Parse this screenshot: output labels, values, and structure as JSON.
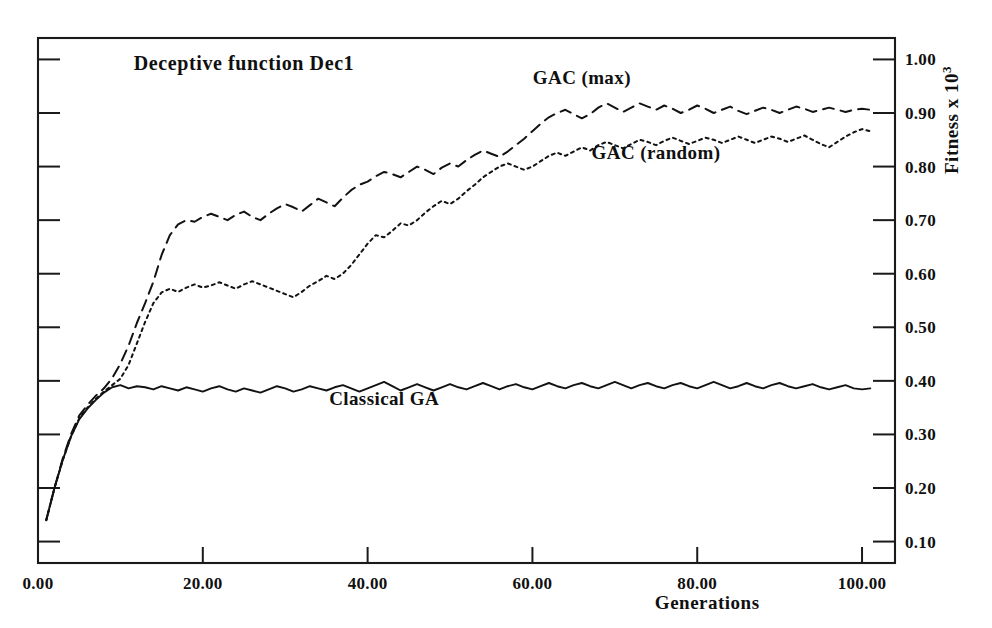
{
  "chart_data": {
    "type": "line",
    "title": "Deceptive function Dec1",
    "xlabel": "Generations",
    "ylabel": "Fitness x 10",
    "ylabel_exponent": "3",
    "xlim": [
      0,
      104
    ],
    "ylim": [
      0.06,
      1.04
    ],
    "xticks": [
      0,
      20,
      40,
      60,
      80,
      100
    ],
    "xtick_labels": [
      "0.00",
      "20.00",
      "40.00",
      "60.00",
      "80.00",
      "100.00"
    ],
    "yticks": [
      0.1,
      0.2,
      0.3,
      0.4,
      0.5,
      0.6,
      0.7,
      0.8,
      0.9,
      1.0
    ],
    "ytick_labels": [
      "0.10",
      "0.20",
      "0.30",
      "0.40",
      "0.50",
      "0.60",
      "0.70",
      "0.80",
      "0.90",
      "1.00"
    ],
    "grid": false,
    "legend_position": "inline-annotations",
    "y_axis_side": "right",
    "series": [
      {
        "name": "GAC (max)",
        "style": "dashed",
        "label_x": 66,
        "label_y": 0.955,
        "x": [
          1,
          2,
          3,
          4,
          5,
          6,
          7,
          8,
          9,
          10,
          11,
          12,
          13,
          14,
          15,
          16,
          17,
          18,
          19,
          20,
          21,
          22,
          23,
          24,
          25,
          26,
          27,
          28,
          29,
          30,
          31,
          32,
          33,
          34,
          35,
          36,
          37,
          38,
          39,
          40,
          41,
          42,
          43,
          44,
          45,
          46,
          47,
          48,
          49,
          50,
          51,
          52,
          53,
          54,
          55,
          56,
          57,
          58,
          59,
          60,
          61,
          62,
          63,
          64,
          65,
          66,
          67,
          68,
          69,
          70,
          71,
          72,
          73,
          74,
          75,
          76,
          77,
          78,
          79,
          80,
          81,
          82,
          83,
          84,
          85,
          86,
          87,
          88,
          89,
          90,
          91,
          92,
          93,
          94,
          95,
          96,
          97,
          98,
          99,
          100,
          101
        ],
        "y": [
          0.14,
          0.2,
          0.255,
          0.3,
          0.335,
          0.355,
          0.372,
          0.386,
          0.405,
          0.432,
          0.466,
          0.508,
          0.545,
          0.585,
          0.635,
          0.672,
          0.692,
          0.7,
          0.697,
          0.706,
          0.712,
          0.706,
          0.7,
          0.71,
          0.716,
          0.706,
          0.7,
          0.712,
          0.722,
          0.73,
          0.724,
          0.716,
          0.728,
          0.74,
          0.733,
          0.726,
          0.742,
          0.756,
          0.766,
          0.772,
          0.782,
          0.79,
          0.786,
          0.78,
          0.79,
          0.8,
          0.794,
          0.786,
          0.798,
          0.806,
          0.8,
          0.812,
          0.822,
          0.83,
          0.824,
          0.818,
          0.828,
          0.84,
          0.852,
          0.866,
          0.88,
          0.892,
          0.9,
          0.906,
          0.898,
          0.89,
          0.898,
          0.91,
          0.918,
          0.91,
          0.902,
          0.91,
          0.918,
          0.912,
          0.906,
          0.914,
          0.908,
          0.9,
          0.906,
          0.914,
          0.908,
          0.9,
          0.906,
          0.912,
          0.904,
          0.898,
          0.904,
          0.91,
          0.906,
          0.9,
          0.906,
          0.912,
          0.908,
          0.902,
          0.906,
          0.91,
          0.906,
          0.902,
          0.906,
          0.908,
          0.906
        ]
      },
      {
        "name": "GAC (random)",
        "style": "dotted",
        "label_x": 75,
        "label_y": 0.815,
        "x": [
          1,
          2,
          3,
          4,
          5,
          6,
          7,
          8,
          9,
          10,
          11,
          12,
          13,
          14,
          15,
          16,
          17,
          18,
          19,
          20,
          21,
          22,
          23,
          24,
          25,
          26,
          27,
          28,
          29,
          30,
          31,
          32,
          33,
          34,
          35,
          36,
          37,
          38,
          39,
          40,
          41,
          42,
          43,
          44,
          45,
          46,
          47,
          48,
          49,
          50,
          51,
          52,
          53,
          54,
          55,
          56,
          57,
          58,
          59,
          60,
          61,
          62,
          63,
          64,
          65,
          66,
          67,
          68,
          69,
          70,
          71,
          72,
          73,
          74,
          75,
          76,
          77,
          78,
          79,
          80,
          81,
          82,
          83,
          84,
          85,
          86,
          87,
          88,
          89,
          90,
          91,
          92,
          93,
          94,
          95,
          96,
          97,
          98,
          99,
          100,
          101
        ],
        "y": [
          0.14,
          0.2,
          0.252,
          0.296,
          0.33,
          0.35,
          0.366,
          0.38,
          0.392,
          0.404,
          0.43,
          0.47,
          0.51,
          0.545,
          0.565,
          0.572,
          0.566,
          0.574,
          0.58,
          0.574,
          0.578,
          0.584,
          0.578,
          0.572,
          0.58,
          0.586,
          0.58,
          0.574,
          0.568,
          0.562,
          0.556,
          0.566,
          0.578,
          0.586,
          0.596,
          0.59,
          0.6,
          0.616,
          0.636,
          0.656,
          0.672,
          0.668,
          0.68,
          0.694,
          0.69,
          0.7,
          0.714,
          0.726,
          0.736,
          0.73,
          0.74,
          0.754,
          0.766,
          0.78,
          0.79,
          0.8,
          0.806,
          0.8,
          0.794,
          0.8,
          0.81,
          0.82,
          0.826,
          0.82,
          0.828,
          0.836,
          0.83,
          0.84,
          0.846,
          0.84,
          0.834,
          0.842,
          0.85,
          0.846,
          0.84,
          0.848,
          0.854,
          0.848,
          0.842,
          0.848,
          0.854,
          0.85,
          0.844,
          0.85,
          0.856,
          0.85,
          0.844,
          0.85,
          0.856,
          0.852,
          0.846,
          0.852,
          0.858,
          0.85,
          0.842,
          0.836,
          0.846,
          0.856,
          0.864,
          0.87,
          0.866
        ]
      },
      {
        "name": "Classical GA",
        "style": "solid",
        "label_x": 42,
        "label_y": 0.355,
        "x": [
          1,
          2,
          3,
          4,
          5,
          6,
          7,
          8,
          9,
          10,
          11,
          12,
          13,
          14,
          15,
          16,
          17,
          18,
          19,
          20,
          21,
          22,
          23,
          24,
          25,
          26,
          27,
          28,
          29,
          30,
          31,
          32,
          33,
          34,
          35,
          36,
          37,
          38,
          39,
          40,
          41,
          42,
          43,
          44,
          45,
          46,
          47,
          48,
          49,
          50,
          51,
          52,
          53,
          54,
          55,
          56,
          57,
          58,
          59,
          60,
          61,
          62,
          63,
          64,
          65,
          66,
          67,
          68,
          69,
          70,
          71,
          72,
          73,
          74,
          75,
          76,
          77,
          78,
          79,
          80,
          81,
          82,
          83,
          84,
          85,
          86,
          87,
          88,
          89,
          90,
          91,
          92,
          93,
          94,
          95,
          96,
          97,
          98,
          99,
          100,
          101
        ],
        "y": [
          0.14,
          0.2,
          0.252,
          0.296,
          0.328,
          0.348,
          0.364,
          0.378,
          0.388,
          0.392,
          0.386,
          0.39,
          0.388,
          0.384,
          0.39,
          0.386,
          0.382,
          0.388,
          0.384,
          0.38,
          0.386,
          0.39,
          0.384,
          0.38,
          0.386,
          0.382,
          0.378,
          0.384,
          0.39,
          0.386,
          0.38,
          0.384,
          0.39,
          0.386,
          0.382,
          0.388,
          0.392,
          0.386,
          0.38,
          0.386,
          0.392,
          0.398,
          0.39,
          0.382,
          0.388,
          0.394,
          0.388,
          0.382,
          0.388,
          0.394,
          0.388,
          0.384,
          0.39,
          0.396,
          0.39,
          0.384,
          0.39,
          0.394,
          0.388,
          0.384,
          0.39,
          0.396,
          0.39,
          0.386,
          0.392,
          0.396,
          0.39,
          0.386,
          0.392,
          0.398,
          0.392,
          0.386,
          0.392,
          0.396,
          0.39,
          0.386,
          0.392,
          0.396,
          0.39,
          0.386,
          0.392,
          0.398,
          0.392,
          0.386,
          0.39,
          0.396,
          0.39,
          0.386,
          0.392,
          0.396,
          0.39,
          0.386,
          0.39,
          0.394,
          0.388,
          0.384,
          0.388,
          0.392,
          0.386,
          0.384,
          0.386
        ]
      }
    ]
  }
}
